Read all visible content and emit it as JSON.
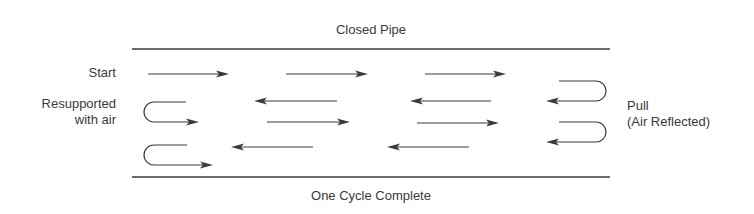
{
  "diagram": {
    "title": "Closed Pipe",
    "footer": "One Cycle Complete",
    "labels": {
      "start": "Start",
      "resupported_line1": "Resupported",
      "resupported_line2": "with air",
      "pull_line1": "Pull",
      "pull_line2": "(Air Reflected)"
    },
    "colors": {
      "stroke": "#3a3a3a",
      "text": "#3a3a3a",
      "background": "#ffffff"
    },
    "pipe_walls": {
      "top_y": 49,
      "bottom_y": 177,
      "x_start": 132,
      "x_end": 610
    },
    "arrows": [
      {
        "dir": "right",
        "x1": 148,
        "x2": 229,
        "y": 74
      },
      {
        "dir": "right",
        "x1": 286,
        "x2": 368,
        "y": 74
      },
      {
        "dir": "right",
        "x1": 425,
        "x2": 506,
        "y": 74
      },
      {
        "dir": "left",
        "x1": 337,
        "x2": 254,
        "y": 101
      },
      {
        "dir": "left",
        "x1": 491,
        "x2": 410,
        "y": 101
      },
      {
        "dir": "right",
        "x1": 267,
        "x2": 350,
        "y": 122
      },
      {
        "dir": "right",
        "x1": 417,
        "x2": 499,
        "y": 123
      },
      {
        "dir": "left",
        "x1": 313,
        "x2": 231,
        "y": 147
      },
      {
        "dir": "left",
        "x1": 469,
        "x2": 387,
        "y": 147
      }
    ],
    "u_turns": [
      {
        "side": "left",
        "label": "resupported",
        "top_y": 102,
        "bottom_y": 122,
        "x_open": 186,
        "x_tip": 199
      },
      {
        "side": "left",
        "label": "resupported",
        "top_y": 145,
        "bottom_y": 165,
        "x_open": 187,
        "x_tip": 213
      },
      {
        "side": "right",
        "label": "pull",
        "top_y": 81,
        "bottom_y": 101,
        "x_open": 559,
        "x_tip": 546
      },
      {
        "side": "right",
        "label": "pull",
        "top_y": 122,
        "bottom_y": 142,
        "x_open": 559,
        "x_tip": 546
      }
    ]
  }
}
